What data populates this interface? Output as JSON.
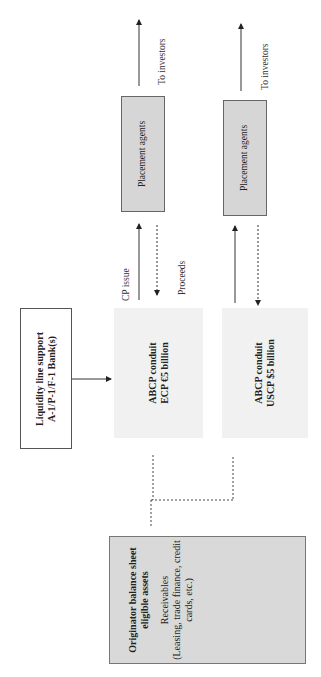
{
  "diagram": {
    "orientation": "rotated-90-counterclockwise",
    "nodes": {
      "liquidity": {
        "line1": "Liquidity line support",
        "line2": "A-1/P-1/F-1 Bank(s)"
      },
      "conduit_ecp": {
        "line1": "ABCP conduit",
        "line2": "ECP €5 billion"
      },
      "conduit_uscp": {
        "line1": "ABCP conduit",
        "line2": "USCP $5 billion"
      },
      "agent_1": {
        "label": "Placement agents"
      },
      "agent_2": {
        "label": "Placement agents"
      },
      "originator": {
        "title1": "Originator balance sheet",
        "title2": "eligible assets",
        "body1": "Receivables",
        "body2": "(Leasing, trade finance, credit",
        "body3": "cards, etc.)"
      }
    },
    "edge_labels": {
      "cp_issue": "CP issue",
      "proceeds": "Proceeds",
      "to_investors_1": "To investors",
      "to_investors_2": "To investors"
    },
    "colors": {
      "conduit_fill": "#f1f1f1",
      "agent_fill": "#d6d6d6",
      "originator_fill": "#d9d9d9",
      "line": "#333333"
    }
  }
}
